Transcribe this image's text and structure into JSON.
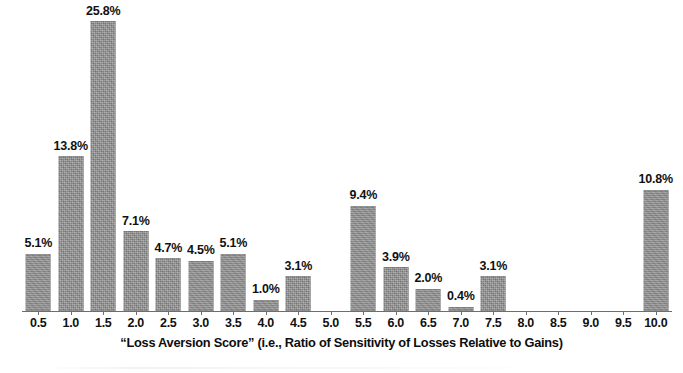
{
  "chart_data": {
    "type": "bar",
    "title": "",
    "subtitle": "",
    "xlabel": "“Loss Aversion Score” (i.e., Ratio of Sensitivity of Losses Relative to Gains)",
    "ylabel": "",
    "ylim": [
      0,
      27
    ],
    "grid": false,
    "legend": null,
    "legend_position": "none",
    "value_suffix": "%",
    "bar_color": "#8b8b8b",
    "axis_color": "#6e6e6e",
    "text_color": "#111111",
    "categories": [
      "0.5",
      "1.0",
      "1.5",
      "2.0",
      "2.5",
      "3.0",
      "3.5",
      "4.0",
      "4.5",
      "5.0",
      "5.5",
      "6.0",
      "6.5",
      "7.0",
      "7.5",
      "8.0",
      "8.5",
      "9.0",
      "9.5",
      "10.0"
    ],
    "values": [
      5.1,
      13.8,
      25.8,
      7.1,
      4.7,
      4.5,
      5.1,
      1.0,
      3.1,
      0.0,
      9.4,
      3.9,
      2.0,
      0.4,
      3.1,
      0.0,
      0.0,
      0.0,
      0.0,
      10.8
    ],
    "data_labels": [
      "5.1%",
      "13.8%",
      "25.8%",
      "7.1%",
      "4.7%",
      "4.5%",
      "5.1%",
      "1.0%",
      "3.1%",
      "",
      "9.4%",
      "3.9%",
      "2.0%",
      "0.4%",
      "3.1%",
      "",
      "",
      "",
      "",
      "10.8%"
    ],
    "tick_labels": [
      "0.5",
      "1.0",
      "1.5",
      "2.0",
      "2.5",
      "3.0",
      "3.5",
      "4.0",
      "4.5",
      "5.0",
      "5.5",
      "6.0",
      "6.5",
      "7.0",
      "7.5",
      "8.0",
      "8.5",
      "9.0",
      "9.5",
      "10.0"
    ]
  }
}
